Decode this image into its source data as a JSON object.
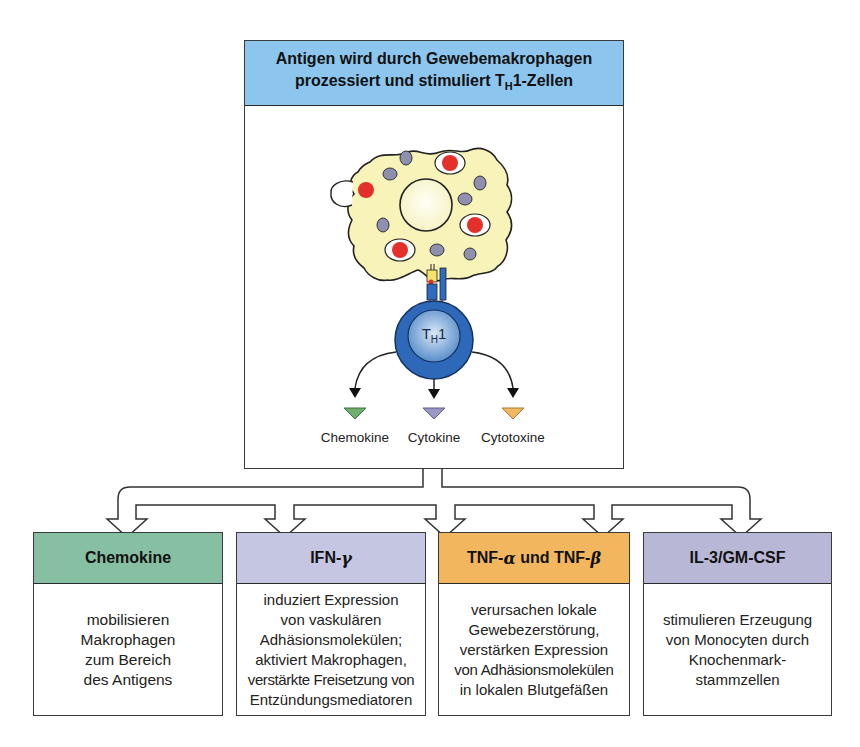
{
  "top_box": {
    "title_line1": "Antigen wird durch Gewebemakrophagen",
    "title_line2_pre": "prozessiert und stimuliert T",
    "title_line2_sub": "H",
    "title_line2_post": "1-Zellen",
    "header_color": "#8cc6ee"
  },
  "cell": {
    "label_main": "T",
    "label_sub": "H",
    "label_post": "1"
  },
  "secretions": [
    {
      "label": "Chemokine",
      "color": "#6fae6f"
    },
    {
      "label": "Cytokine",
      "color": "#9a97c4"
    },
    {
      "label": "Cytotoxine",
      "color": "#f0b860"
    }
  ],
  "cards": [
    {
      "title": "Chemokine",
      "color": "#86bfa2",
      "lines": [
        "mobilisieren",
        "Makrophagen",
        "zum Bereich",
        "des Antigens"
      ]
    },
    {
      "title_pre": "IFN-",
      "title_greek": "γ",
      "color": "#c4c6e2",
      "lines": [
        "induziert Expression",
        "von vaskulären",
        "Adhäsionsmolekülen;",
        "aktiviert Makrophagen,",
        "verstärkte Freisetzung von",
        "Entzündungsmediatoren"
      ]
    },
    {
      "title_pre": "TNF-",
      "title_greek": "α",
      "title_mid": " und TNF-",
      "title_greek2": "β",
      "color": "#f2b75e",
      "lines": [
        "verursachen lokale",
        "Gewebezerstörung,",
        "verstärken Expression",
        "von Adhäsionsmolekülen",
        "in lokalen Blutgefäßen"
      ]
    },
    {
      "title": "IL-3/GM-CSF",
      "color": "#b8b8d6",
      "lines": [
        "stimulieren Erzeugung",
        "von Monocyten durch",
        "Knochenmark-",
        "stammzellen"
      ]
    }
  ]
}
